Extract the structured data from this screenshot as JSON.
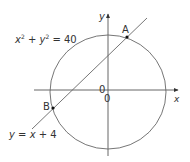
{
  "diagram": {
    "circle_equation": {
      "x": "x",
      "x_exp": "2",
      "plus": " + ",
      "y": "y",
      "y_exp": "2",
      "rhs": " = 40"
    },
    "line_equation": {
      "y": "y",
      "eq": " = ",
      "x": "x",
      "rest": " + 4"
    },
    "points": {
      "A": "A",
      "B": "B"
    },
    "origin_labels": [
      "0",
      "0"
    ],
    "axes": {
      "x": "x",
      "y": "y"
    },
    "colors": {
      "stroke": "#555555",
      "text": "#333333",
      "point": "#111111"
    }
  }
}
